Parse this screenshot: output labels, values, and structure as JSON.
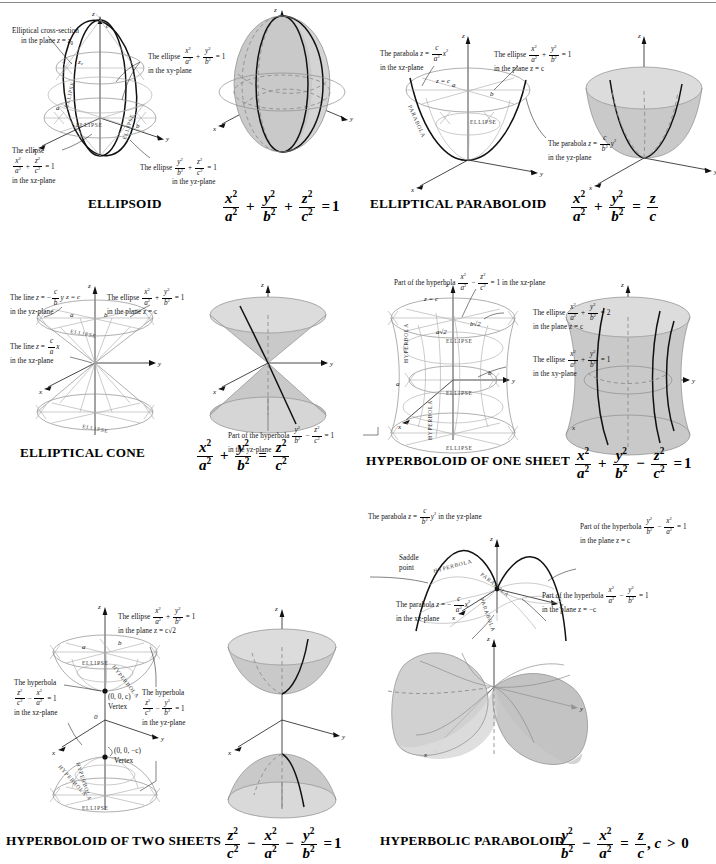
{
  "page": {
    "background": "#ffffff",
    "surface_fill": "#c9c9c9",
    "accent_line": "#1a1a1a"
  },
  "panels": [
    {
      "id": "ellipsoid",
      "title": "ELLIPSOID",
      "equation_text": "x^2/a^2 + y^2/b^2 + z^2/c^2 = 1",
      "axis_labels": [
        "x",
        "y",
        "z"
      ],
      "point_labels": [
        "a",
        "b",
        "c",
        "z0"
      ],
      "curve_labels": [
        "ELLIPSE",
        "ELLIPSE",
        "ELLIPSE"
      ],
      "annotations": [
        {
          "id": "cross-section",
          "line1": "Elliptical cross-section",
          "line2": "in the plane z = z₀"
        },
        {
          "id": "xy-ellipse",
          "line1": "The ellipse",
          "frac": "x²/a² + y²/b² = 1",
          "line2": "in the xy-plane"
        },
        {
          "id": "xz-ellipse",
          "line1": "The ellipse",
          "frac": "x²/a² + z²/c² = 1",
          "line2": "in the xz-plane"
        },
        {
          "id": "yz-ellipse",
          "line1": "The ellipse",
          "frac": "y²/b² + z²/c² = 1",
          "line2": "in the yz-plane"
        }
      ]
    },
    {
      "id": "elliptical-paraboloid",
      "title": "ELLIPTICAL PARABOLOID",
      "equation_text": "x^2/a^2 + y^2/b^2 = z/c",
      "axis_labels": [
        "x",
        "y",
        "z"
      ],
      "point_labels": [
        "a",
        "b",
        "z = c"
      ],
      "curve_labels": [
        "PARABOLA",
        "ELLIPSE"
      ],
      "annotations": [
        {
          "id": "xz-parabola",
          "line1": "The parabola z =",
          "frac": "c/a² x²",
          "line2": "in the xz-plane"
        },
        {
          "id": "plane-ellipse",
          "line1": "The ellipse",
          "frac": "x²/a² + y²/b² = 1",
          "line2": "in the plane z = c"
        },
        {
          "id": "yz-parabola",
          "line1": "The parabola z =",
          "frac": "c/b² y²",
          "line2": "in the yz-plane"
        }
      ]
    },
    {
      "id": "elliptical-cone",
      "title": "ELLIPTICAL CONE",
      "equation_text": "x^2/a^2 + y^2/b^2 = z^2/c^2",
      "axis_labels": [
        "x",
        "y",
        "z"
      ],
      "point_labels": [
        "a",
        "b",
        "z = c"
      ],
      "curve_labels": [
        "ELLIPSE",
        "ELLIPSE"
      ],
      "annotations": [
        {
          "id": "yz-line",
          "line1": "The line z = −",
          "frac": "c/b y",
          "line2": "in the yz-plane"
        },
        {
          "id": "plane-ellipse",
          "line1": "The ellipse",
          "frac": "x²/a² + y²/b² = 1",
          "line2": "in the plane z = c"
        },
        {
          "id": "xz-line",
          "line1": "The line z =",
          "frac": "c/a x",
          "line2": "in the xz-plane"
        }
      ]
    },
    {
      "id": "hyperboloid-one-sheet",
      "title": "HYPERBOLOID OF ONE SHEET",
      "equation_text": "x^2/a^2 + y^2/b^2 − z^2/c^2 = 1",
      "axis_labels": [
        "x",
        "y",
        "z"
      ],
      "point_labels": [
        "a",
        "b",
        "a√2",
        "b√2",
        "z = c"
      ],
      "curve_labels": [
        "HYPERBOLA",
        "HYPERBOLA",
        "ELLIPSE",
        "ELLIPSE",
        "ELLIPSE"
      ],
      "annotations": [
        {
          "id": "xz-hyperbola",
          "line1": "Part of the hyperbola",
          "frac": "x²/a² − z²/c² = 1",
          "line2": "in the xz-plane"
        },
        {
          "id": "plane-ellipse-2",
          "line1": "The ellipse",
          "frac": "x²/a² + y²/b² = 2",
          "line2": "in the plane z = c"
        },
        {
          "id": "xy-ellipse",
          "line1": "The ellipse",
          "frac": "x²/a² + y²/b² = 1",
          "line2": "in the xy-plane"
        },
        {
          "id": "yz-hyperbola",
          "line1": "Part of the hyperbola",
          "frac": "y²/b² − z²/c² = 1",
          "line2": "in the yz-plane"
        }
      ]
    },
    {
      "id": "hyperboloid-two-sheets",
      "title": "HYPERBOLOID OF TWO SHEETS",
      "equation_text": "z^2/c^2 − x^2/a^2 − y^2/b^2 = 1",
      "axis_labels": [
        "x",
        "y",
        "z",
        "0"
      ],
      "point_labels": [
        "a",
        "b",
        "(0, 0, c)",
        "Vertex",
        "(0, 0, −c)",
        "Vertex"
      ],
      "curve_labels": [
        "ELLIPSE",
        "ELLIPSE",
        "HYPERBOLA",
        "HYPERBOLA",
        "HYPERBOLA"
      ],
      "annotations": [
        {
          "id": "plane-ellipse",
          "line1": "The ellipse",
          "frac": "x²/a² + y²/b² = 1",
          "line2": "in the plane z = c√2"
        },
        {
          "id": "xz-hyperbola",
          "line1": "The hyperbola",
          "frac": "z²/c² − x²/a² = 1",
          "line2": "in the xz-plane"
        },
        {
          "id": "yz-hyperbola",
          "line1": "The hyperbola",
          "frac": "z²/c² − y²/b² = 1",
          "line2": "in the yz-plane"
        }
      ]
    },
    {
      "id": "hyperbolic-paraboloid",
      "title": "HYPERBOLIC PARABOLOID",
      "equation_text": "y^2/b^2 − x^2/a^2 = z/c, c > 0",
      "axis_labels": [
        "x",
        "y",
        "z"
      ],
      "point_labels": [
        "Saddle",
        "point"
      ],
      "curve_labels": [
        "HYPERBOLA",
        "PARABOLA",
        "PARABOLA"
      ],
      "annotations": [
        {
          "id": "yz-parabola",
          "line1": "The parabola z =",
          "frac": "c/b² y²",
          "line2": "in the yz-plane"
        },
        {
          "id": "plane-c-hyperbola",
          "line1": "Part of the hyperbola",
          "frac": "y²/b² − x²/a² = 1",
          "line2": "in the plane z = c"
        },
        {
          "id": "plane-negc-hyperbola",
          "line1": "Part of the hyperbola",
          "frac": "x²/a² − y²/b² = 1",
          "line2": "in the plane z = −c"
        },
        {
          "id": "xz-parabola",
          "line1": "The parabola z = −",
          "frac": "c/a² x²",
          "line2": "in the xz-plane"
        }
      ]
    }
  ],
  "labels": {
    "ellipse": "ELLIPSE",
    "hyperbola": "HYPERBOLA",
    "parabola": "PARABOLA",
    "vertex": "Vertex",
    "saddle_line1": "Saddle",
    "saddle_line2": "point",
    "zc": "z = c",
    "origin": "0",
    "a": "a",
    "b": "b",
    "c": "c",
    "x": "x",
    "y": "y",
    "z": "z",
    "z0": "z₀",
    "asqrt2": "a√2",
    "bsqrt2": "b√2",
    "vertex_top": "(0, 0, c)",
    "vertex_bottom": "(0, 0, −c)"
  },
  "text": {
    "the_ellipse": "The ellipse",
    "the_hyperbola": "The hyperbola",
    "the_line": "The line",
    "the_parabola": "The parabola",
    "part_of_the_hyperbola": "Part of the hyperbola",
    "elliptical_cross_section": "Elliptical cross-section",
    "in_plane_z_z0": "in the plane z = z₀",
    "in_the_xy_plane": "in the xy-plane",
    "in_the_xz_plane": "in the xz-plane",
    "in_the_yz_plane": "in the yz-plane",
    "in_the_plane_z_c": "in the plane z = c",
    "in_the_plane_z_negc": "in the plane z = −c",
    "in_the_plane_z_csqrt2": "in the plane z = c√2",
    "in_xz_plane_tail": "in the xz-plane",
    "eq1": "= 1",
    "eq2": "= 2"
  }
}
